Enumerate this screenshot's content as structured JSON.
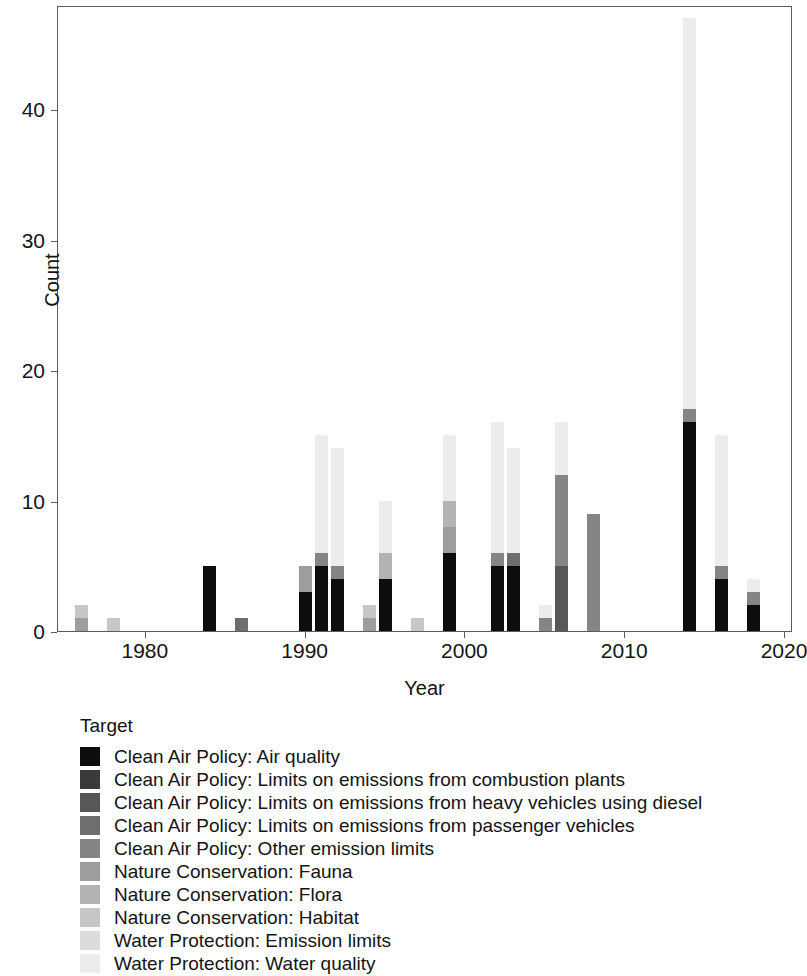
{
  "chart_data": {
    "type": "bar",
    "subtype": "stacked-bar",
    "title": "",
    "xlabel": "Year",
    "ylabel": "Count",
    "xlim": [
      1974.5,
      2020.5
    ],
    "ylim": [
      0,
      48
    ],
    "xticks": [
      1980,
      1990,
      2000,
      2010,
      2020
    ],
    "xtick_labels": [
      "1980",
      "1990",
      "2000",
      "2010",
      "2020"
    ],
    "yticks": [
      0,
      10,
      20,
      30,
      40
    ],
    "ytick_labels": [
      "0",
      "10",
      "20",
      "30",
      "40"
    ],
    "grid": false,
    "legend_position": "below",
    "legend_title": "Target",
    "series": [
      {
        "name": "Clean Air Policy: Air quality",
        "color": "#0d0d0d"
      },
      {
        "name": "Clean Air Policy: Limits on emissions from combustion plants",
        "color": "#3a3a3a"
      },
      {
        "name": "Clean Air Policy: Limits on emissions from heavy vehicles using diesel",
        "color": "#575757"
      },
      {
        "name": "Clean Air Policy: Limits on emissions from passenger vehicles",
        "color": "#6e6e6e"
      },
      {
        "name": "Clean Air Policy: Other emission limits",
        "color": "#858585"
      },
      {
        "name": "Nature Conservation: Fauna",
        "color": "#9d9d9d"
      },
      {
        "name": "Nature Conservation: Flora",
        "color": "#b3b3b3"
      },
      {
        "name": "Nature Conservation: Habitat",
        "color": "#c6c6c6"
      },
      {
        "name": "Water Protection: Emission limits",
        "color": "#dcdcdc"
      },
      {
        "name": "Water Protection: Water quality",
        "color": "#ececec"
      }
    ],
    "categories": [
      1976,
      1978,
      1984,
      1986,
      1990,
      1991,
      1992,
      1994,
      1995,
      1997,
      1999,
      2002,
      2003,
      2005,
      2006,
      2008,
      2014,
      2016,
      2018
    ],
    "bars": [
      {
        "x": 1976,
        "total": 2,
        "segments": [
          0,
          0,
          0,
          0,
          0,
          1,
          0,
          1,
          0,
          0
        ]
      },
      {
        "x": 1978,
        "total": 1,
        "segments": [
          0,
          0,
          0,
          0,
          0,
          0,
          0,
          1,
          0,
          0
        ]
      },
      {
        "x": 1984,
        "total": 5,
        "segments": [
          5,
          0,
          0,
          0,
          0,
          0,
          0,
          0,
          0,
          0
        ]
      },
      {
        "x": 1986,
        "total": 1,
        "segments": [
          0,
          0,
          0,
          1,
          0,
          0,
          0,
          0,
          0,
          0
        ]
      },
      {
        "x": 1990,
        "total": 5,
        "segments": [
          3,
          0,
          0,
          0,
          0,
          2,
          0,
          0,
          0,
          0
        ]
      },
      {
        "x": 1991,
        "total": 15,
        "segments": [
          5,
          0,
          0,
          0,
          1,
          0,
          0,
          0,
          0,
          9
        ]
      },
      {
        "x": 1992,
        "total": 14,
        "segments": [
          4,
          0,
          0,
          0,
          1,
          0,
          0,
          0,
          0,
          9
        ]
      },
      {
        "x": 1994,
        "total": 2,
        "segments": [
          0,
          0,
          0,
          0,
          0,
          1,
          0,
          1,
          0,
          0
        ]
      },
      {
        "x": 1995,
        "total": 10,
        "segments": [
          4,
          0,
          0,
          0,
          0,
          0,
          2,
          0,
          0,
          4
        ]
      },
      {
        "x": 1997,
        "total": 1,
        "segments": [
          0,
          0,
          0,
          0,
          0,
          0,
          0,
          1,
          0,
          0
        ]
      },
      {
        "x": 1999,
        "total": 15,
        "segments": [
          6,
          0,
          0,
          0,
          0,
          2,
          2,
          0,
          0,
          5
        ]
      },
      {
        "x": 2002,
        "total": 16,
        "segments": [
          5,
          0,
          0,
          0,
          1,
          0,
          0,
          0,
          0,
          10
        ]
      },
      {
        "x": 2003,
        "total": 14,
        "segments": [
          5,
          0,
          0,
          1,
          0,
          0,
          0,
          0,
          0,
          8
        ]
      },
      {
        "x": 2005,
        "total": 2,
        "segments": [
          0,
          0,
          0,
          0,
          1,
          0,
          0,
          0,
          0,
          1
        ]
      },
      {
        "x": 2006,
        "total": 16,
        "segments": [
          0,
          0,
          5,
          0,
          7,
          0,
          0,
          0,
          0,
          4
        ]
      },
      {
        "x": 2008,
        "total": 9,
        "segments": [
          0,
          0,
          0,
          0,
          9,
          0,
          0,
          0,
          0,
          0
        ]
      },
      {
        "x": 2014,
        "total": 47,
        "segments": [
          16,
          0,
          0,
          0,
          1,
          0,
          0,
          0,
          0,
          30
        ]
      },
      {
        "x": 2016,
        "total": 15,
        "segments": [
          4,
          0,
          0,
          0,
          1,
          0,
          0,
          0,
          0,
          10
        ]
      },
      {
        "x": 2018,
        "total": 4,
        "segments": [
          2,
          0,
          0,
          0,
          1,
          0,
          0,
          0,
          0,
          1
        ]
      }
    ]
  },
  "axes": {
    "ylabel": "Count",
    "xlabel": "Year",
    "ytick_labels": [
      "0",
      "10",
      "20",
      "30",
      "40"
    ],
    "xtick_labels": [
      "1980",
      "1990",
      "2000",
      "2010",
      "2020"
    ]
  },
  "legend": {
    "title": "Target",
    "entries": [
      {
        "label": "Clean Air Policy: Air quality",
        "color": "#0d0d0d"
      },
      {
        "label": "Clean Air Policy: Limits on emissions from combustion plants",
        "color": "#3a3a3a"
      },
      {
        "label": "Clean Air Policy: Limits on emissions from heavy vehicles using diesel",
        "color": "#575757"
      },
      {
        "label": "Clean Air Policy: Limits on emissions from passenger vehicles",
        "color": "#6e6e6e"
      },
      {
        "label": "Clean Air Policy: Other emission limits",
        "color": "#858585"
      },
      {
        "label": "Nature Conservation: Fauna",
        "color": "#9d9d9d"
      },
      {
        "label": "Nature Conservation: Flora",
        "color": "#b3b3b3"
      },
      {
        "label": "Nature Conservation: Habitat",
        "color": "#c6c6c6"
      },
      {
        "label": "Water Protection: Emission limits",
        "color": "#dcdcdc"
      },
      {
        "label": "Water Protection: Water quality",
        "color": "#ececec"
      }
    ]
  }
}
